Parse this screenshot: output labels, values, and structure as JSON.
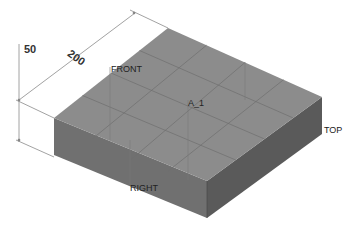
{
  "diagram": {
    "type": "isometric-box",
    "colors": {
      "top_face": "#8c8c8c",
      "left_face": "#707070",
      "right_face": "#5a5a5a",
      "grid": "#6e6e6e",
      "dimension_line": "#8a8a8a"
    },
    "dimensions": {
      "height": "50",
      "length": "200"
    },
    "plane_labels": {
      "front": "FRONT",
      "right": "RIGHT",
      "top": "TOP"
    },
    "annotation": "A_1"
  }
}
